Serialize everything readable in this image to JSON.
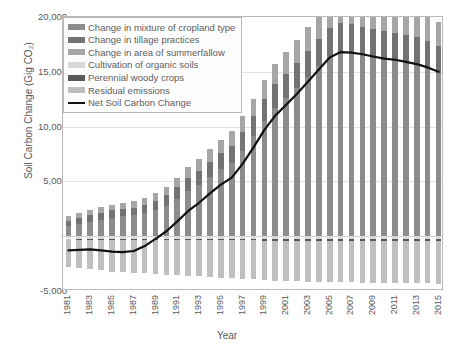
{
  "axes": {
    "ylabel": "Soil Carbon Change (Gig CO₂)",
    "xlabel": "Year",
    "yticks": [
      "20,000",
      "15,000",
      "10,000",
      "5,000",
      "0",
      "-5,000"
    ],
    "ytick_values": [
      20000,
      15000,
      10000,
      5000,
      0,
      -5000
    ],
    "xticks": [
      "1981",
      "1983",
      "1985",
      "1987",
      "1989",
      "1991",
      "1993",
      "1995",
      "1997",
      "1999",
      "2001",
      "2003",
      "2005",
      "2007",
      "2009",
      "2011",
      "2013",
      "2015"
    ]
  },
  "legend": {
    "items": [
      {
        "label": "Change in mixture of cropland type",
        "color": "#8c8c8c",
        "kind": "swatch"
      },
      {
        "label": "Change in tillage practices",
        "color": "#737373",
        "kind": "swatch"
      },
      {
        "label": "Change in area of summerfallow",
        "color": "#a6a6a6",
        "kind": "swatch"
      },
      {
        "label": "Cultivation of organic soils",
        "color": "#d9d9d9",
        "kind": "swatch"
      },
      {
        "label": "Perennial woody crops",
        "color": "#595959",
        "kind": "swatch"
      },
      {
        "label": "Residual emissions",
        "color": "#bfbfbf",
        "kind": "swatch"
      },
      {
        "label": "Net Soil Carbon Change",
        "color": "#111111",
        "kind": "line"
      }
    ]
  },
  "chart_data": {
    "type": "bar",
    "stacked": true,
    "title": "",
    "xlabel": "Year",
    "ylabel": "Soil Carbon Change (Gig CO₂)",
    "ylim": [
      -5000,
      20000
    ],
    "grid": true,
    "legend_position": "top-left",
    "overlay_line": {
      "name": "Net Soil Carbon Change",
      "color": "#111111",
      "values": [
        -1300,
        -1250,
        -1200,
        -1300,
        -1400,
        -1450,
        -1350,
        -900,
        -250,
        450,
        1350,
        2300,
        3050,
        3900,
        4700,
        5350,
        6600,
        8100,
        9700,
        11000,
        12000,
        13000,
        14100,
        15200,
        16300,
        16800,
        16750,
        16600,
        16400,
        16200,
        16100,
        15900,
        15700,
        15400,
        15000
      ]
    },
    "categories": [
      "1981",
      "1982",
      "1983",
      "1984",
      "1985",
      "1986",
      "1987",
      "1988",
      "1989",
      "1990",
      "1991",
      "1992",
      "1993",
      "1994",
      "1995",
      "1996",
      "1997",
      "1998",
      "1999",
      "2000",
      "2001",
      "2002",
      "2003",
      "2004",
      "2005",
      "2006",
      "2007",
      "2008",
      "2009",
      "2010",
      "2011",
      "2012",
      "2013",
      "2014",
      "2015"
    ],
    "series": [
      {
        "name": "Change in mixture of cropland type",
        "color": "#8c8c8c",
        "values": [
          900,
          1100,
          1300,
          1500,
          1700,
          1800,
          1900,
          2100,
          2400,
          2800,
          3400,
          4100,
          4700,
          5400,
          6100,
          6700,
          7800,
          9100,
          10500,
          11700,
          12600,
          13500,
          14500,
          15500,
          16400,
          16800,
          16700,
          16500,
          16300,
          16100,
          16000,
          15800,
          15600,
          15300,
          14900
        ]
      },
      {
        "name": "Change in tillage practices",
        "color": "#737373",
        "values": [
          520,
          560,
          600,
          640,
          660,
          680,
          700,
          760,
          840,
          930,
          1060,
          1180,
          1280,
          1380,
          1470,
          1540,
          1690,
          1850,
          2020,
          2150,
          2240,
          2330,
          2430,
          2530,
          2620,
          2660,
          2650,
          2630,
          2610,
          2590,
          2580,
          2560,
          2540,
          2510,
          2470
        ]
      },
      {
        "name": "Change in area of summerfallow",
        "color": "#a6a6a6",
        "values": [
          380,
          420,
          460,
          500,
          530,
          550,
          570,
          620,
          690,
          770,
          880,
          990,
          1080,
          1170,
          1250,
          1320,
          1450,
          1600,
          1750,
          1870,
          1960,
          2040,
          2130,
          2220,
          2300,
          2340,
          2330,
          2310,
          2290,
          2270,
          2260,
          2240,
          2220,
          2190,
          2150
        ]
      },
      {
        "name": "Cultivation of organic soils",
        "color": "#d9d9d9",
        "values": [
          -210,
          -215,
          -220,
          -225,
          -228,
          -230,
          -232,
          -235,
          -238,
          -240,
          -243,
          -246,
          -249,
          -252,
          -255,
          -258,
          -261,
          -264,
          -267,
          -270,
          -272,
          -274,
          -276,
          -278,
          -280,
          -281,
          -282,
          -283,
          -284,
          -285,
          -286,
          -287,
          -288,
          -289,
          -290
        ]
      },
      {
        "name": "Perennial woody crops",
        "color": "#595959",
        "values": [
          -90,
          -92,
          -94,
          -96,
          -98,
          -100,
          -102,
          -104,
          -106,
          -108,
          -110,
          -112,
          -114,
          -116,
          -118,
          -120,
          -122,
          -124,
          -126,
          -128,
          -130,
          -132,
          -134,
          -136,
          -138,
          -139,
          -140,
          -141,
          -142,
          -143,
          -144,
          -145,
          -146,
          -147,
          -148
        ]
      },
      {
        "name": "Residual emissions",
        "color": "#bfbfbf",
        "values": [
          -2500,
          -2600,
          -2700,
          -2800,
          -2900,
          -2950,
          -3000,
          -3050,
          -3100,
          -3150,
          -3200,
          -3250,
          -3300,
          -3350,
          -3400,
          -3450,
          -3500,
          -3550,
          -3600,
          -3650,
          -3700,
          -3720,
          -3740,
          -3760,
          -3780,
          -3790,
          -3800,
          -3810,
          -3820,
          -3830,
          -3840,
          -3850,
          -3860,
          -3870,
          -3880
        ]
      }
    ]
  }
}
